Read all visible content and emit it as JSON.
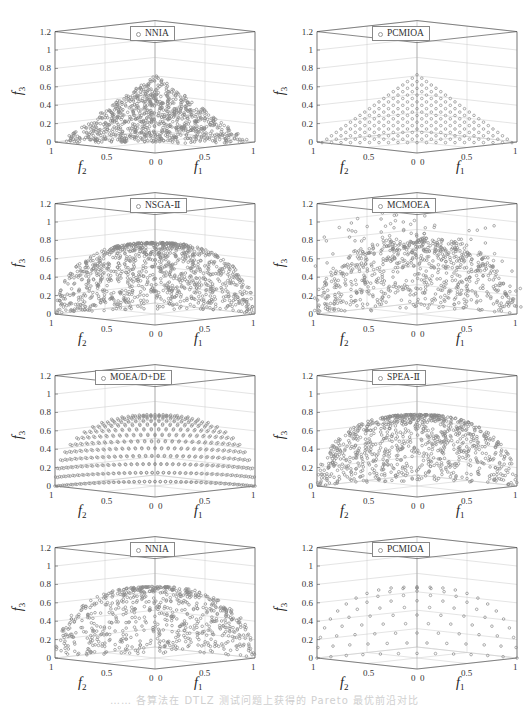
{
  "caption": "…… 各算法在 DTLZ 测试问题上获得的 Pareto 最优前沿对比",
  "axis": {
    "z_ticks": [
      "0",
      "0.2",
      "0.4",
      "0.6",
      "0.8",
      "1",
      "1.2"
    ],
    "f2_ticks": [
      "1",
      "0.5",
      "0"
    ],
    "f1_ticks": [
      "0",
      "0.5",
      "1"
    ],
    "xlabel_f2": "f",
    "xlabel_f2_sub": "2",
    "xlabel_f1": "f",
    "xlabel_f1_sub": "1",
    "zlabel": "f",
    "zlabel_sub": "3"
  },
  "colors": {
    "marker": "#8a8a8a",
    "grid": "#c8c8c8",
    "box": "#555555"
  },
  "panels": [
    {
      "legend": "NNIA",
      "front": "plane",
      "dist": "random",
      "n": 900
    },
    {
      "legend": "PCMIOA",
      "front": "plane",
      "dist": "grid",
      "n": 20
    },
    {
      "legend": "NSGA-Ⅱ",
      "front": "sphere",
      "dist": "random",
      "n": 1100
    },
    {
      "legend": "MCMOEA",
      "front": "sphere",
      "dist": "noisy",
      "n": 800
    },
    {
      "legend": "MOEA/D+DE",
      "front": "sphere",
      "dist": "arcs",
      "n": 14
    },
    {
      "legend": "SPEA-Ⅱ",
      "front": "sphere",
      "dist": "random",
      "n": 900
    },
    {
      "legend": "NNIA",
      "front": "sphere",
      "dist": "random",
      "n": 700
    },
    {
      "legend": "PCMIOA",
      "front": "sphere",
      "dist": "grid",
      "n": 12
    }
  ],
  "chart_data": [
    {
      "type": "scatter3d",
      "title": "NNIA",
      "front": "linear plane f1+f2+f3=1 (DTLZ1-like, max f3≈0.85)",
      "distribution": "random, dense",
      "xlabel": "f1",
      "ylabel": "f2",
      "zlabel": "f3",
      "xlim": [
        0,
        1
      ],
      "ylim": [
        0,
        1
      ],
      "zlim": [
        0,
        1.2
      ],
      "z_ticks": [
        0,
        0.2,
        0.4,
        0.6,
        0.8,
        1,
        1.2
      ],
      "grid": true,
      "legend_position": "top center"
    },
    {
      "type": "scatter3d",
      "title": "PCMIOA",
      "front": "linear plane f1+f2+f3=1",
      "distribution": "uniform grid",
      "xlabel": "f1",
      "ylabel": "f2",
      "zlabel": "f3",
      "xlim": [
        0,
        1
      ],
      "ylim": [
        0,
        1
      ],
      "zlim": [
        0,
        1.2
      ],
      "grid": true,
      "legend_position": "top center"
    },
    {
      "type": "scatter3d",
      "title": "NSGA-Ⅱ",
      "front": "spherical f1²+f2²+f3²=1",
      "distribution": "random, dense",
      "xlabel": "f1",
      "ylabel": "f2",
      "zlabel": "f3",
      "xlim": [
        0,
        1
      ],
      "ylim": [
        0,
        1
      ],
      "zlim": [
        0,
        1.2
      ],
      "grid": true,
      "legend_position": "top center"
    },
    {
      "type": "scatter3d",
      "title": "MCMOEA",
      "front": "spherical, with scattered outliers up to f3≈1.2",
      "distribution": "noisy",
      "xlabel": "f1",
      "ylabel": "f2",
      "zlabel": "f3",
      "xlim": [
        0,
        1
      ],
      "ylim": [
        0,
        1
      ],
      "zlim": [
        0,
        1.2
      ],
      "grid": true,
      "legend_position": "top center"
    },
    {
      "type": "scatter3d",
      "title": "MOEA/D+DE",
      "front": "spherical",
      "distribution": "concentric arcs",
      "xlabel": "f1",
      "ylabel": "f2",
      "zlabel": "f3",
      "xlim": [
        0,
        1
      ],
      "ylim": [
        0,
        1
      ],
      "zlim": [
        0,
        1.2
      ],
      "grid": true,
      "legend_position": "top center"
    },
    {
      "type": "scatter3d",
      "title": "SPEA-Ⅱ",
      "front": "spherical",
      "distribution": "random, dense",
      "xlabel": "f1",
      "ylabel": "f2",
      "zlabel": "f3",
      "xlim": [
        0,
        1
      ],
      "ylim": [
        0,
        1
      ],
      "zlim": [
        0,
        1.2
      ],
      "grid": true,
      "legend_position": "top center"
    },
    {
      "type": "scatter3d",
      "title": "NNIA",
      "front": "spherical",
      "distribution": "random",
      "xlabel": "f1",
      "ylabel": "f2",
      "zlabel": "f3",
      "xlim": [
        0,
        1
      ],
      "ylim": [
        0,
        1
      ],
      "zlim": [
        0,
        1.2
      ],
      "grid": true,
      "legend_position": "top center"
    },
    {
      "type": "scatter3d",
      "title": "PCMIOA",
      "front": "spherical",
      "distribution": "uniform grid",
      "xlabel": "f1",
      "ylabel": "f2",
      "zlabel": "f3",
      "xlim": [
        0,
        1
      ],
      "ylim": [
        0,
        1
      ],
      "zlim": [
        0,
        1.2
      ],
      "grid": true,
      "legend_position": "top center"
    }
  ]
}
